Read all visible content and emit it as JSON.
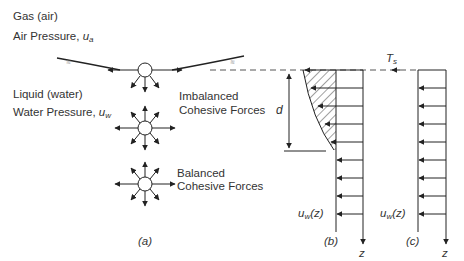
{
  "diagram": {
    "panel_a": {
      "gas_label": "Gas (air)",
      "air_pressure_label": "Air Pressure, ",
      "air_pressure_symbol": "u",
      "air_pressure_sub": "a",
      "liquid_label": "Liquid (water)",
      "water_pressure_label": "Water Pressure, ",
      "water_pressure_symbol": "u",
      "water_pressure_sub": "w",
      "imbalanced_line1": "Imbalanced",
      "imbalanced_line2": "Cohesive Forces",
      "balanced_line1": "Balanced",
      "balanced_line2": "Cohesive Forces",
      "caption": "(a)"
    },
    "panel_b": {
      "dimension_label": "d",
      "pressure_label": "u",
      "pressure_sub": "w",
      "pressure_arg": "(z)",
      "axis_label": "z",
      "caption": "(b)"
    },
    "panel_c": {
      "tension_label": "T",
      "tension_sub": "s",
      "pressure_label": "u",
      "pressure_sub": "w",
      "pressure_arg": "(z)",
      "axis_label": "z",
      "caption": "(c)"
    },
    "colors": {
      "line": "#222222",
      "dashed": "#555555",
      "hatch": "#444444"
    }
  }
}
